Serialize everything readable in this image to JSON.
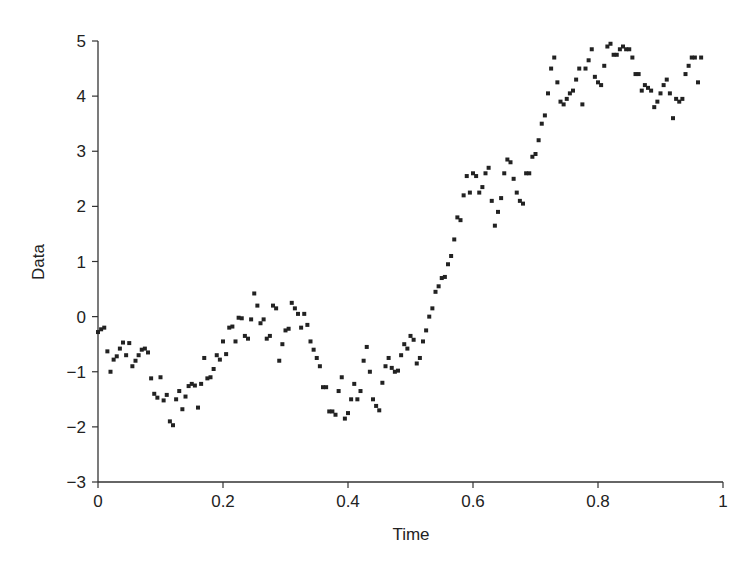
{
  "chart_data": {
    "type": "scatter",
    "title": "",
    "xlabel": "Time",
    "ylabel": "Data",
    "xlim": [
      0,
      1
    ],
    "ylim": [
      -3,
      5
    ],
    "xticks": [
      "0",
      "0.2",
      "0.4",
      "0.6",
      "0.8",
      "1"
    ],
    "yticks": [
      "-3",
      "-2",
      "-1",
      "0",
      "1",
      "2",
      "3",
      "4",
      "5"
    ],
    "grid": false,
    "legend": null,
    "marker": "square",
    "color": "#222222",
    "x": [
      0.0,
      0.005,
      0.01,
      0.015,
      0.02,
      0.025,
      0.03,
      0.035,
      0.04,
      0.045,
      0.05,
      0.055,
      0.06,
      0.065,
      0.07,
      0.075,
      0.08,
      0.085,
      0.09,
      0.095,
      0.1,
      0.105,
      0.11,
      0.115,
      0.12,
      0.125,
      0.13,
      0.135,
      0.14,
      0.145,
      0.15,
      0.155,
      0.16,
      0.165,
      0.17,
      0.175,
      0.18,
      0.185,
      0.19,
      0.195,
      0.2,
      0.205,
      0.21,
      0.215,
      0.22,
      0.225,
      0.23,
      0.235,
      0.24,
      0.245,
      0.25,
      0.255,
      0.26,
      0.265,
      0.27,
      0.275,
      0.28,
      0.285,
      0.29,
      0.295,
      0.3,
      0.305,
      0.31,
      0.315,
      0.32,
      0.325,
      0.33,
      0.335,
      0.34,
      0.345,
      0.35,
      0.355,
      0.36,
      0.365,
      0.37,
      0.375,
      0.38,
      0.385,
      0.39,
      0.395,
      0.4,
      0.405,
      0.41,
      0.415,
      0.42,
      0.425,
      0.43,
      0.435,
      0.44,
      0.445,
      0.45,
      0.455,
      0.46,
      0.465,
      0.47,
      0.475,
      0.48,
      0.485,
      0.49,
      0.495,
      0.5,
      0.505,
      0.51,
      0.515,
      0.52,
      0.525,
      0.53,
      0.535,
      0.54,
      0.545,
      0.55,
      0.555,
      0.56,
      0.565,
      0.57,
      0.575,
      0.58,
      0.585,
      0.59,
      0.595,
      0.6,
      0.605,
      0.61,
      0.615,
      0.62,
      0.625,
      0.63,
      0.635,
      0.64,
      0.645,
      0.65,
      0.655,
      0.66,
      0.665,
      0.67,
      0.675,
      0.68,
      0.685,
      0.69,
      0.695,
      0.7,
      0.705,
      0.71,
      0.715,
      0.72,
      0.725,
      0.73,
      0.735,
      0.74,
      0.745,
      0.75,
      0.755,
      0.76,
      0.765,
      0.77,
      0.775,
      0.78,
      0.785,
      0.79,
      0.795,
      0.8,
      0.805,
      0.81,
      0.815,
      0.82,
      0.825,
      0.83,
      0.835,
      0.84,
      0.845,
      0.85,
      0.855,
      0.86,
      0.865,
      0.87,
      0.875,
      0.88,
      0.885,
      0.89,
      0.895,
      0.9,
      0.905,
      0.91,
      0.915,
      0.92,
      0.925,
      0.93,
      0.935,
      0.94,
      0.945,
      0.95,
      0.955,
      0.96,
      0.965,
      0.97,
      0.975,
      0.98,
      0.985,
      0.99,
      0.995
    ],
    "y": [
      -0.28,
      -0.23,
      -0.2,
      -0.63,
      -1.0,
      -0.78,
      -0.72,
      -0.58,
      -0.47,
      -0.7,
      -0.48,
      -0.9,
      -0.8,
      -0.7,
      -0.6,
      -0.58,
      -0.65,
      -1.12,
      -1.4,
      -1.47,
      -1.1,
      -1.52,
      -1.42,
      -1.9,
      -1.97,
      -1.5,
      -1.35,
      -1.68,
      -1.45,
      -1.26,
      -1.22,
      -1.25,
      -1.65,
      -1.22,
      -0.75,
      -1.12,
      -1.1,
      -0.95,
      -0.7,
      -0.78,
      -0.45,
      -0.68,
      -0.2,
      -0.18,
      -0.45,
      -0.02,
      -0.03,
      -0.35,
      -0.4,
      -0.05,
      0.42,
      0.2,
      -0.12,
      -0.05,
      -0.4,
      -0.35,
      0.2,
      0.15,
      -0.8,
      -0.5,
      -0.25,
      -0.22,
      0.25,
      0.15,
      0.05,
      -0.2,
      0.05,
      -0.15,
      -0.45,
      -0.6,
      -0.75,
      -0.9,
      -1.28,
      -1.28,
      -1.72,
      -1.72,
      -1.78,
      -1.35,
      -1.1,
      -1.85,
      -1.75,
      -1.5,
      -1.22,
      -1.5,
      -1.35,
      -0.8,
      -0.55,
      -1.0,
      -1.5,
      -1.62,
      -1.7,
      -1.2,
      -0.9,
      -0.75,
      -0.93,
      -1.0,
      -0.98,
      -0.7,
      -0.5,
      -0.58,
      -0.35,
      -0.42,
      -0.85,
      -0.75,
      -0.45,
      -0.25,
      0.0,
      0.15,
      0.45,
      0.55,
      0.7,
      0.72,
      0.95,
      1.1,
      1.4,
      1.8,
      1.75,
      2.2,
      2.55,
      2.25,
      2.6,
      2.55,
      2.25,
      2.35,
      2.6,
      2.7,
      2.1,
      1.65,
      1.9,
      2.15,
      2.6,
      2.85,
      2.8,
      2.5,
      2.25,
      2.1,
      2.05,
      2.6,
      2.6,
      2.9,
      2.95,
      3.2,
      3.5,
      3.65,
      4.05,
      4.5,
      4.7,
      4.25,
      3.9,
      3.85,
      3.95,
      4.05,
      4.1,
      4.3,
      4.5,
      3.85,
      4.5,
      4.65,
      4.85,
      4.35,
      4.25,
      4.2,
      4.55,
      4.9,
      4.95,
      4.75,
      4.75,
      4.85,
      4.9,
      4.85,
      4.85,
      4.7,
      4.4,
      4.4,
      4.1,
      4.2,
      4.15,
      4.1,
      3.8,
      3.9,
      4.05,
      4.2,
      4.3,
      4.05,
      3.6,
      3.95,
      3.9,
      3.95,
      4.4,
      4.55,
      4.7,
      4.7,
      4.25,
      4.7
    ]
  }
}
